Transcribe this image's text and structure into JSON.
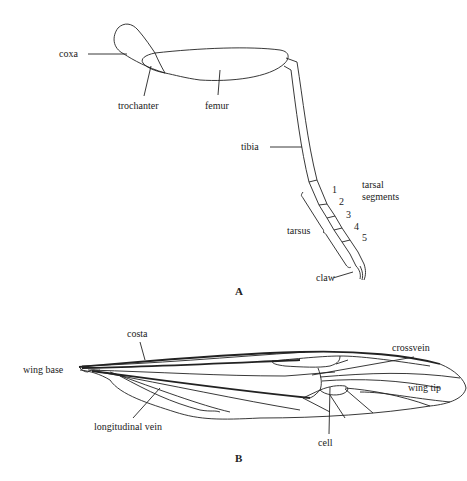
{
  "figure": {
    "panel_a": {
      "letter": "A",
      "title": "insect leg",
      "labels": {
        "coxa": "coxa",
        "trochanter": "trochanter",
        "femur": "femur",
        "tibia": "tibia",
        "tarsal_segments_line1": "tarsal",
        "tarsal_segments_line2": "segments",
        "tarsus": "tarsus",
        "claw": "claw"
      },
      "segment_numbers": [
        "1",
        "2",
        "3",
        "4",
        "5"
      ]
    },
    "panel_b": {
      "letter": "B",
      "title": "insect wing",
      "labels": {
        "costa": "costa",
        "wing_base": "wing base",
        "crossvein": "crossvein",
        "wing_tip": "wing tip",
        "longitudinal_vein": "longitudinal vein",
        "cell": "cell"
      }
    },
    "colors": {
      "line": "#222222",
      "background": "#ffffff"
    }
  }
}
